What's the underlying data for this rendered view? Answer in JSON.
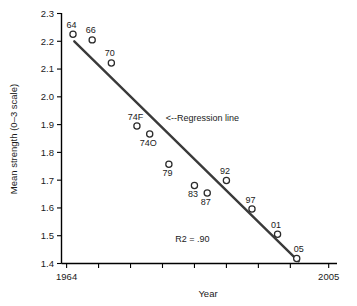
{
  "chart_data": {
    "type": "scatter",
    "title": "",
    "xlabel": "Year",
    "ylabel": "Mean strength (0–3 scale)",
    "xlim": [
      1963,
      2006
    ],
    "ylim": [
      1.4,
      2.3
    ],
    "grid": false,
    "legend": "none",
    "y_ticks": [
      "2.3",
      "2.2",
      "2.1",
      "2.0",
      "1.9",
      "1.8",
      "1.7",
      "1.6",
      "1.5",
      "1.4"
    ],
    "y_tick_values": [
      2.3,
      2.2,
      2.1,
      2.0,
      1.9,
      1.8,
      1.7,
      1.6,
      1.5,
      1.4
    ],
    "x_ticks": [
      "1964",
      "",
      "",
      "",
      "",
      "",
      "",
      "",
      "2005"
    ],
    "x_tick_values": [
      1964,
      1969,
      1974,
      1979,
      1984,
      1989,
      1994,
      1999,
      2005
    ],
    "points": [
      {
        "label": "64",
        "x": 1965,
        "y": 2.225,
        "label_pos": "above-left"
      },
      {
        "label": "66",
        "x": 1968,
        "y": 2.205,
        "label_pos": "above-left"
      },
      {
        "label": "70",
        "x": 1971,
        "y": 2.122,
        "label_pos": "above-left"
      },
      {
        "label": "74F",
        "x": 1975,
        "y": 1.895,
        "label_pos": "above-left"
      },
      {
        "label": "74O",
        "x": 1977,
        "y": 1.866,
        "label_pos": "below-left"
      },
      {
        "label": "79",
        "x": 1980,
        "y": 1.757,
        "label_pos": "below-left"
      },
      {
        "label": "83",
        "x": 1984,
        "y": 1.681,
        "label_pos": "below-left"
      },
      {
        "label": "87",
        "x": 1986,
        "y": 1.654,
        "label_pos": "below-left"
      },
      {
        "label": "92",
        "x": 1989,
        "y": 1.699,
        "label_pos": "above-left"
      },
      {
        "label": "97",
        "x": 1993,
        "y": 1.596,
        "label_pos": "above-left"
      },
      {
        "label": "01",
        "x": 1997,
        "y": 1.505,
        "label_pos": "above-left"
      },
      {
        "label": "05",
        "x": 2000,
        "y": 1.418,
        "label_pos": "above-right"
      }
    ],
    "regression_line": {
      "x_start": 1965.2,
      "y_start": 2.2,
      "x_end": 2000.3,
      "y_end": 1.408
    },
    "annotations": [
      {
        "name": "regression-line-callout",
        "text": "<--Regression line",
        "x": 1979.5,
        "y": 1.912
      },
      {
        "name": "r-squared",
        "text": "R2 = .90",
        "x": 1981.0,
        "y": 1.477
      }
    ]
  }
}
